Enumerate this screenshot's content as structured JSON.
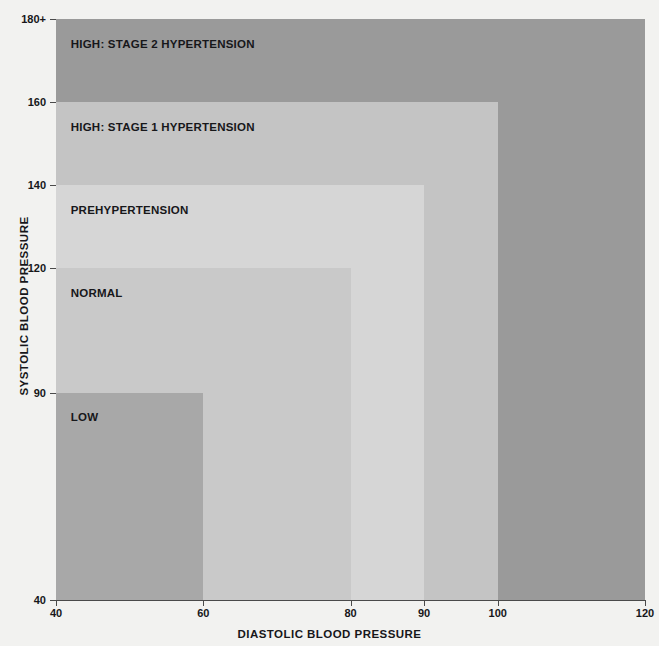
{
  "chart_data": {
    "type": "area",
    "title": "Blood pressure readings",
    "xlabel": "DIASTOLIC BLOOD PRESSURE",
    "ylabel": "SYSTOLIC BLOOD PRESSURE",
    "xlim": [
      40,
      120
    ],
    "ylim": [
      40,
      180
    ],
    "grid": false,
    "legend": "none",
    "xticks": [
      "40",
      "60",
      "80",
      "90",
      "100",
      "120"
    ],
    "xtick_values": [
      40,
      60,
      80,
      90,
      100,
      120
    ],
    "yticks": [
      "40",
      "90",
      "120",
      "140",
      "160",
      "180+"
    ],
    "ytick_values": [
      40,
      90,
      120,
      140,
      160,
      180
    ],
    "zones": [
      {
        "name": "HIGH: STAGE 2 HYPERTENSION",
        "systolic_max": 180,
        "diastolic_max": 120,
        "color": "#9a9a9a",
        "label_x": 42,
        "label_y": 174
      },
      {
        "name": "HIGH: STAGE 1 HYPERTENSION",
        "systolic_max": 160,
        "diastolic_max": 100,
        "color": "#c4c4c4",
        "label_x": 42,
        "label_y": 154
      },
      {
        "name": "PREHYPERTENSION",
        "systolic_max": 140,
        "diastolic_max": 90,
        "color": "#d6d6d6",
        "label_x": 42,
        "label_y": 134
      },
      {
        "name": "NORMAL",
        "systolic_max": 120,
        "diastolic_max": 80,
        "color": "#c9c9c9",
        "label_x": 42,
        "label_y": 114
      },
      {
        "name": "LOW",
        "systolic_max": 90,
        "diastolic_max": 60,
        "color": "#a8a8a8",
        "label_x": 42,
        "label_y": 84
      }
    ]
  },
  "readings": {
    "heading": "Blood pressure readings",
    "body": "Measuring blood pressure as the heart beats gives systolic (beating) and diastolic (rest) values. An average healthy blood pressure reading is below 120/80. A person has hypertension if their reading is higher than this over a sustained period. Factors that cause blood pressure to rise include eating too much salt, being obese, drinking too much alcohol, and smoking. It can be countered through dietary and lifestyle changes."
  },
  "side_note": {
    "heading": "Stages of hypertension",
    "body": "As blood pressure rises above the normal level it reaches a stage of prehypertension before two stages of hypertension. At stage 2 the risk of developing cardio-vascular diseases is very high."
  },
  "colors": {
    "background": "#f2f2f0",
    "axis": "#4a4a4a",
    "text": "#17171a"
  }
}
